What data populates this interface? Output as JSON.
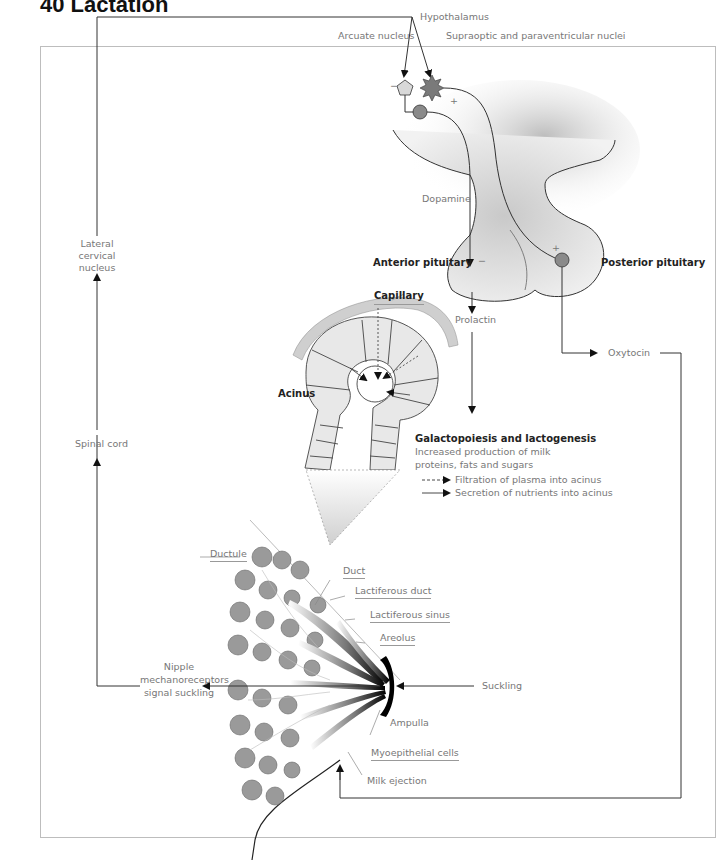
{
  "page": {
    "title": "40 Lactation"
  },
  "labels": {
    "hypothalamus": "Hypothalamus",
    "arcuate_nucleus": "Arcuate nucleus",
    "supraoptic_nuclei": "Supraoptic and paraventricular nuclei",
    "minus_arcuate": "−",
    "plus_supraoptic": "+",
    "dopamine": "Dopamine",
    "anterior_pituitary": "Anterior pituitary",
    "posterior_pituitary": "Posterior pituitary",
    "minus_anterior": "−",
    "plus_posterior": "+",
    "lateral_cervical_nucleus": "Lateral\ncervical nucleus",
    "prolactin": "Prolactin",
    "oxytocin": "Oxytocin",
    "capillary": "Capillary",
    "acinus": "Acinus",
    "galacto_title": "Galactopoiesis and lactogenesis",
    "galacto_line1": "Increased production of milk",
    "galacto_line2": "proteins, fats and sugars",
    "spinal_cord": "Spinal cord",
    "ductule": "Ductule",
    "duct": "Duct",
    "lactiferous_duct": "Lactiferous duct",
    "lactiferous_sinus": "Lactiferous sinus",
    "areolus": "Areolus",
    "nipple_line1": "Nipple",
    "nipple_line2": "mechanoreceptors",
    "nipple_line3": "signal suckling",
    "suckling": "Suckling",
    "ampulla": "Ampulla",
    "myoepithelial_cells": "Myoepithelial cells",
    "milk_ejection": "Milk ejection"
  },
  "legend": {
    "items": [
      {
        "style": "dashed",
        "label": "Filtration of plasma into acinus"
      },
      {
        "style": "solid",
        "label": "Secretion of nutrients into acinus"
      }
    ]
  },
  "colors": {
    "line": "#333333",
    "label_gray": "#777777",
    "pituitary_fill": "#e6e6e6",
    "neuron_fill": "#8a8a8a",
    "capillary_fill": "#cfcfcf",
    "cell_fill": "#e8e8e8",
    "lobule_fill": "#9a9a9a"
  }
}
